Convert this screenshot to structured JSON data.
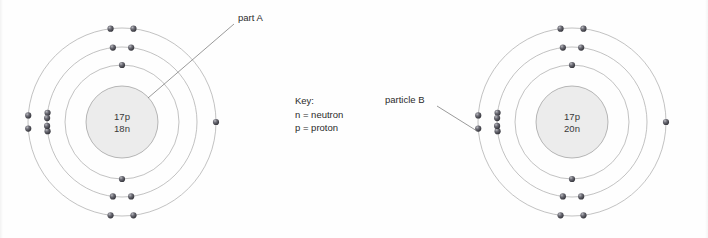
{
  "diagram": {
    "background_color": "#fefefe",
    "shell_stroke_color": "#a8a8a8",
    "nucleus_fill_color": "#ececec",
    "nucleus_stroke_color": "#9a9a9a",
    "electron_color": "#3f3f46",
    "leader_color": "#6e6e6e",
    "text_color": "#2b2b2b"
  },
  "atoms": [
    {
      "id": "left-atom",
      "center": {
        "x": 122,
        "y": 122
      },
      "nucleus": {
        "radius": 36,
        "lines": [
          "17p",
          "18n"
        ],
        "protons": "17p",
        "neutrons": "18n"
      },
      "shells": [
        {
          "index": 1,
          "radius": 57,
          "electron_count": 2
        },
        {
          "index": 2,
          "radius": 75,
          "electron_count": 8
        },
        {
          "index": 3,
          "radius": 94,
          "electron_count": 7
        }
      ],
      "callout": {
        "label": "part A",
        "text_x": 238,
        "text_y": 21,
        "line_from": {
          "x": 234,
          "y": 24
        },
        "line_to": {
          "x": 148,
          "y": 98
        }
      }
    },
    {
      "id": "right-atom",
      "center": {
        "x": 572,
        "y": 122
      },
      "nucleus": {
        "radius": 36,
        "lines": [
          "17p",
          "20n"
        ],
        "protons": "17p",
        "neutrons": "20n"
      },
      "shells": [
        {
          "index": 1,
          "radius": 57,
          "electron_count": 2
        },
        {
          "index": 2,
          "radius": 75,
          "electron_count": 8
        },
        {
          "index": 3,
          "radius": 94,
          "electron_count": 7
        }
      ],
      "callout": {
        "label": "particle B",
        "text_x": 385,
        "text_y": 103,
        "line_from": {
          "x": 437,
          "y": 106
        },
        "line_to": {
          "x": 477,
          "y": 131
        }
      }
    }
  ],
  "key": {
    "title": "Key:",
    "x": 295,
    "y": 104,
    "entries": [
      {
        "symbol": "n",
        "equals": "=",
        "meaning": "neutron",
        "text": "n  = neutron"
      },
      {
        "symbol": "p",
        "equals": "=",
        "meaning": "proton",
        "text": "p = proton"
      }
    ]
  },
  "chart_data": {
    "type": "diagram",
    "annotations": [
      "part A",
      "particle B",
      "Key:",
      "n  = neutron",
      "p = proton"
    ],
    "items": [
      {
        "name": "left atom",
        "nucleus_label": "17p 18n",
        "protons": 17,
        "neutrons": 18,
        "shell_electrons": [
          2,
          8,
          7
        ],
        "total_electrons": 17,
        "labeled_part": "part A (nucleus)"
      },
      {
        "name": "right atom",
        "nucleus_label": "17p 20n",
        "protons": 17,
        "neutrons": 20,
        "shell_electrons": [
          2,
          8,
          7
        ],
        "total_electrons": 17,
        "labeled_part": "particle B (outer-shell electron)"
      }
    ]
  }
}
